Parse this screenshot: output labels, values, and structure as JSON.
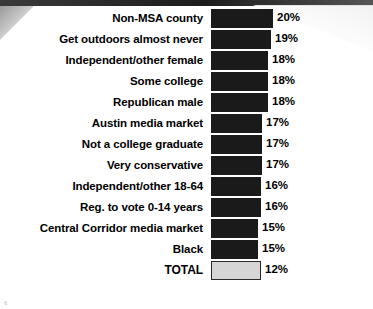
{
  "slide": {
    "page_number": "6"
  },
  "chart_data": {
    "type": "bar",
    "orientation": "horizontal",
    "title": "",
    "xlabel": "",
    "ylabel": "",
    "grid": false,
    "legend": null,
    "value_suffix": "%",
    "xlim": [
      0,
      20
    ],
    "categories": [
      "Non-MSA county",
      "Get outdoors almost never",
      "Independent/other female",
      "Some college",
      "Republican male",
      "Austin media market",
      "Not a college graduate",
      "Very conservative",
      "Independent/other 18-64",
      "Reg. to vote 0-14 years",
      "Central Corridor media market",
      "Black",
      "TOTAL"
    ],
    "values": [
      20,
      19,
      18,
      18,
      18,
      17,
      17,
      17,
      16,
      16,
      15,
      15,
      12
    ],
    "value_labels": [
      "20%",
      "19%",
      "18%",
      "18%",
      "18%",
      "17%",
      "17%",
      "17%",
      "16%",
      "16%",
      "15%",
      "15%",
      "12%"
    ],
    "bar_pixel_widths": [
      62,
      60,
      57,
      57,
      57,
      51,
      51,
      51,
      50,
      50,
      47,
      47,
      50
    ],
    "colors": {
      "bar_fill": "#1a1a1a",
      "total_fill": "#d6d6d6",
      "total_border": "#2a2a2a",
      "text": "#000000",
      "background": "#ffffff",
      "top_band": "#2b2b2b"
    },
    "highlight_row_index": 12
  }
}
